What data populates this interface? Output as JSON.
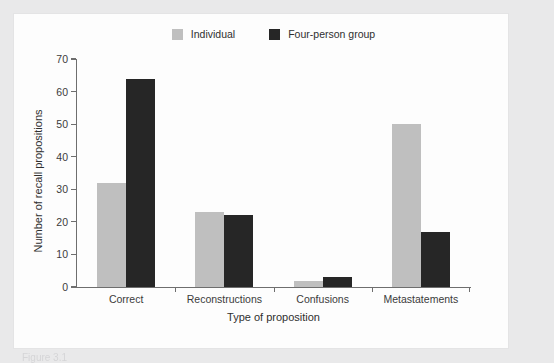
{
  "figure": {
    "caption": "Figure 3.1"
  },
  "chart_data": {
    "type": "bar",
    "title": "",
    "xlabel": "Type of proposition",
    "ylabel": "Number of recall propositions",
    "categories": [
      "Correct",
      "Reconstructions",
      "Confusions",
      "Metastatements"
    ],
    "series": [
      {
        "name": "Individual",
        "color": "#bfbfbf",
        "values": [
          32,
          23,
          2,
          50
        ]
      },
      {
        "name": "Four-person group",
        "color": "#262626",
        "values": [
          64,
          22,
          3,
          17
        ]
      }
    ],
    "ylim": [
      0,
      70
    ],
    "ytick_step": 10,
    "yticks": [
      0,
      10,
      20,
      30,
      40,
      50,
      60,
      70
    ],
    "ytick_labels": [
      "0",
      "10",
      "20",
      "30",
      "40",
      "50",
      "60",
      "70"
    ],
    "grid": false,
    "legend_position": "top-center",
    "background_color": "#fdfdfd",
    "page_background_color": "#e9e9ea",
    "axis_color": "#6e6e6e"
  }
}
